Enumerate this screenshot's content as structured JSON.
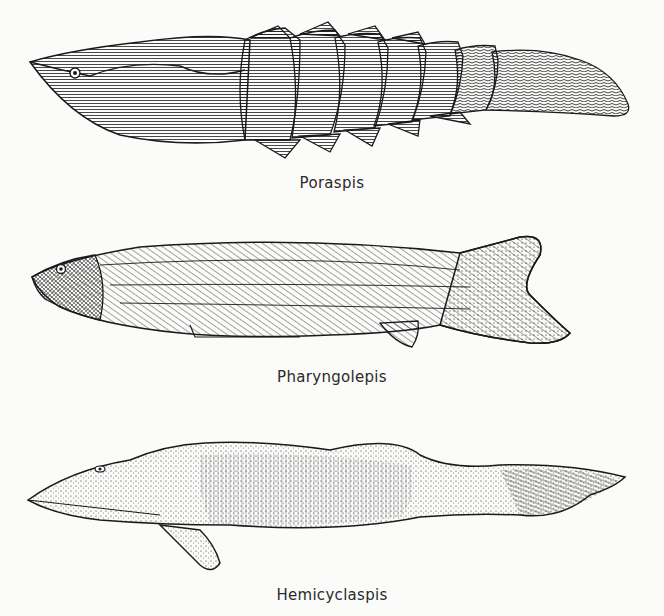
{
  "figures": [
    {
      "caption": "Poraspis",
      "description": "heterostracan jawless fish with armored head shield and scaled tail"
    },
    {
      "caption": "Pharyngolepis",
      "description": "anaspid jawless fish with oblique scale rows and hypocercal tail"
    },
    {
      "caption": "Hemicyclaspis",
      "description": "osteostracan jawless fish with stippled head shield and pectoral fin"
    }
  ],
  "colors": {
    "ink": "#1a1a1a",
    "paper": "#fbfbfa"
  }
}
